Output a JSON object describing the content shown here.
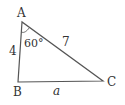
{
  "diagram": {
    "type": "triangle",
    "vertices": {
      "A": {
        "label": "A",
        "x": 22,
        "y": 22
      },
      "B": {
        "label": "B",
        "x": 18,
        "y": 82
      },
      "C": {
        "label": "C",
        "x": 103,
        "y": 81
      }
    },
    "sides": {
      "AB": {
        "label": "4"
      },
      "AC": {
        "label": "7"
      },
      "BC": {
        "label": "a"
      }
    },
    "angles": {
      "A": {
        "label": "60°"
      }
    },
    "colors": {
      "stroke": "#555555",
      "text": "#333333"
    }
  }
}
